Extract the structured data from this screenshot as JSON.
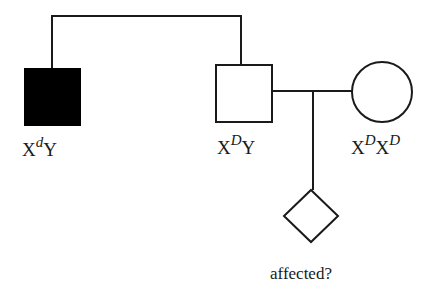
{
  "pedigree": {
    "individuals": [
      {
        "id": "grandfather_affected",
        "sex": "male",
        "affected": true,
        "genotype": {
          "base1": "X",
          "sup1": "d",
          "base2": "Y"
        }
      },
      {
        "id": "father",
        "sex": "male",
        "affected": false,
        "genotype": {
          "base1": "X",
          "sup1": "D",
          "base2": "Y"
        }
      },
      {
        "id": "mother",
        "sex": "female",
        "affected": false,
        "genotype": {
          "base1": "X",
          "sup1": "D",
          "base2": "X",
          "sup2": "D"
        }
      },
      {
        "id": "child",
        "sex": "unknown",
        "affected": null,
        "caption": "affected?"
      }
    ],
    "colors": {
      "line": "#1a1a1a",
      "affected_fill": "#000000",
      "unaffected_fill": "#ffffff"
    }
  }
}
